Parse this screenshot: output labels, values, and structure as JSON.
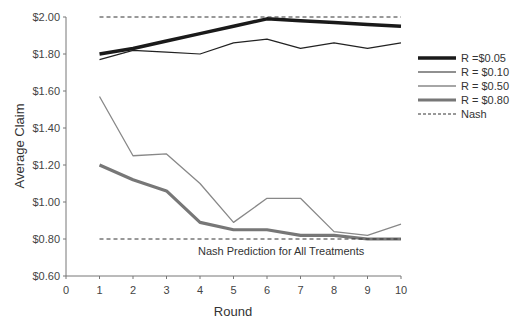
{
  "chart_data": {
    "type": "line",
    "title": "",
    "xlabel": "Round",
    "ylabel": "Average Claim",
    "x": [
      1,
      2,
      3,
      4,
      5,
      6,
      7,
      8,
      9,
      10
    ],
    "xticks": [
      "0",
      "1",
      "2",
      "3",
      "4",
      "5",
      "6",
      "7",
      "8",
      "9",
      "10"
    ],
    "yticks": [
      "$0.60",
      "$0.80",
      "$1.00",
      "$1.20",
      "$1.40",
      "$1.60",
      "$1.80",
      "$2.00"
    ],
    "xlim": [
      0,
      10
    ],
    "ylim": [
      0.6,
      2.0
    ],
    "grid": false,
    "legend_position": "right",
    "series": [
      {
        "name": "R =$0.05",
        "style": "thick-black",
        "values": [
          1.8,
          1.83,
          1.87,
          1.91,
          1.95,
          1.99,
          1.98,
          1.97,
          1.96,
          1.95
        ]
      },
      {
        "name": "R = $0.10",
        "style": "thin-black",
        "values": [
          1.77,
          1.82,
          1.81,
          1.8,
          1.86,
          1.88,
          1.83,
          1.86,
          1.83,
          1.86
        ]
      },
      {
        "name": "R = $0.50",
        "style": "thin-gray",
        "values": [
          1.57,
          1.25,
          1.26,
          1.1,
          0.89,
          1.02,
          1.02,
          0.84,
          0.82,
          0.88
        ]
      },
      {
        "name": "R = $0.80",
        "style": "thick-gray",
        "values": [
          1.2,
          1.12,
          1.06,
          0.89,
          0.85,
          0.85,
          0.82,
          0.82,
          0.8,
          0.8
        ]
      },
      {
        "name": "Nash",
        "style": "dashed",
        "values_upper": [
          2.0,
          2.0,
          2.0,
          2.0,
          2.0,
          2.0,
          2.0,
          2.0,
          2.0,
          2.0
        ],
        "values_lower": [
          0.8,
          0.8,
          0.8,
          0.8,
          0.8,
          0.8,
          0.8,
          0.8,
          0.8,
          0.8
        ]
      }
    ],
    "annotations": [
      "Nash Prediction for All Treatments"
    ]
  },
  "labels": {
    "xlabel": "Round",
    "ylabel": "Average Claim",
    "annotation": "Nash Prediction for All Treatments",
    "legend": [
      "R =$0.05",
      "R = $0.10",
      "R = $0.50",
      "R = $0.80",
      "Nash"
    ]
  }
}
